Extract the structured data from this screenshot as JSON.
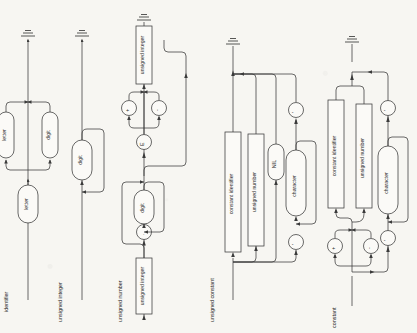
{
  "figure": {
    "kind": "syntax-railroad-diagram",
    "orientation": "rotated-90-ccw",
    "background_color": "#f7f6f2",
    "ink_color": "#3a3a3a"
  },
  "rules": [
    {
      "id": "identifier",
      "name": "identifier",
      "nonterminals": [
        "letter",
        "letter",
        "digit"
      ],
      "terminals": [],
      "end_marker": "ground-terminator"
    },
    {
      "id": "unsigned-integer",
      "name": "unsigned integer",
      "nonterminals": [
        "digit"
      ],
      "terminals": [],
      "end_marker": "ground-terminator"
    },
    {
      "id": "unsigned-number",
      "name": "unsigned number",
      "nonterminals": [
        "unsigned integer",
        "digit",
        "unsigned integer"
      ],
      "terminals": [
        ".",
        "E",
        "+",
        "-"
      ],
      "end_marker": "ground-terminator"
    },
    {
      "id": "unsigned-constant",
      "name": "unsigned constant",
      "nonterminals": [
        "constant identifier",
        "unsigned number",
        "character"
      ],
      "terminals": [
        "NIL",
        "'",
        "'"
      ],
      "end_marker": "ground-terminator"
    },
    {
      "id": "constant",
      "name": "constant",
      "nonterminals": [
        "constant identifier",
        "unsigned number",
        "character"
      ],
      "terminals": [
        "+",
        "-",
        "'",
        "'"
      ],
      "end_marker": "ground-terminator"
    }
  ],
  "labels": {
    "identifier": "identifier",
    "unsigned_integer": "unsigned integer",
    "unsigned_number": "unsigned number",
    "unsigned_constant": "unsigned constant",
    "constant": "constant",
    "letter": "letter",
    "digit": "digit",
    "unsigned_integer_ref": "unsigned integer",
    "unsigned_number_ref": "unsigned number",
    "constant_identifier": "constant identifier",
    "character": "character",
    "nil": "NIL",
    "dot": ".",
    "e": "E",
    "plus": "+",
    "minus": "-",
    "quote": "'"
  }
}
